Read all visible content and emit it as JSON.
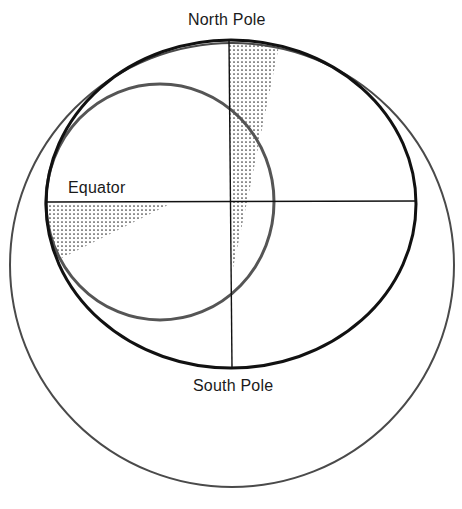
{
  "diagram": {
    "type": "orbital-geometry",
    "labels": {
      "north_pole": "North Pole",
      "south_pole": "South Pole",
      "equator": "Equator"
    },
    "colors": {
      "background": "#ffffff",
      "ellipse_stroke": "#111111",
      "inner_circle_stroke": "#555555",
      "outer_circle_stroke": "#4a4a4a",
      "axis_stroke": "#111111",
      "stipple": "#333333"
    },
    "shapes": {
      "outer_circle": {
        "cx": 232,
        "cy": 265,
        "r": 222
      },
      "ellipse": {
        "cx": 231,
        "cy": 204,
        "rx": 185,
        "ry": 164
      },
      "inner_circle": {
        "cx": 160,
        "cy": 202,
        "rx": 114,
        "ry": 118
      },
      "equator_line": {
        "x1": 46,
        "y1": 202,
        "x2": 416,
        "y2": 201
      },
      "polar_axis": {
        "x1": 229,
        "y1": 41,
        "x2": 232,
        "y2": 368
      },
      "north_wedge_points": "229,42 279,46 247,202 231,202",
      "south_wedge_points": "231,202 247,202 233,268",
      "equator_wedge_points": "47,203 172,203 62,258 50,240"
    }
  }
}
